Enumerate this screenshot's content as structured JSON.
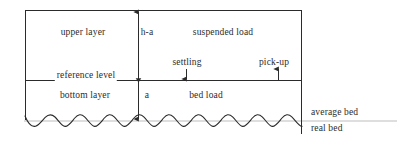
{
  "figure": {
    "type": "schematic-diagram",
    "labels": {
      "upper_layer": "upper layer",
      "height_above_reference": "h-a",
      "suspended_load": "suspended load",
      "settling": "settling",
      "pick_up": "pick-up",
      "reference_level": "reference level",
      "bottom_layer": "bottom layer",
      "reference_height": "a",
      "bed_load": "bed load",
      "average_bed": "average bed",
      "real_bed": "real bed"
    },
    "colors": {
      "line": "#2b2b2b",
      "text": "#2b2b2b",
      "average_bed_line": "#b9b9b9",
      "background": "#ffffff"
    },
    "arrows": {
      "settling_direction": "down",
      "pick_up_direction": "up",
      "height_measure_direction": "both"
    }
  }
}
